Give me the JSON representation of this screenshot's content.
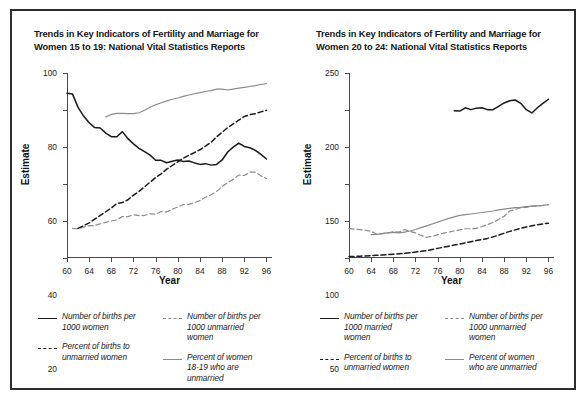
{
  "figure": {
    "border_color": "#2c2c2c",
    "background": "#ffffff"
  },
  "colors": {
    "black": "#1a1a1a",
    "gray": "#8a8a8a",
    "axis": "#4a4a4a",
    "text": "#161616"
  },
  "panels": [
    {
      "id": "panel-left",
      "title_line1": "Trends in Key Indicators of Fertility and Marriage for",
      "title_line2": "Women 15 to 19: National Vital Statistics Reports",
      "xlabel": "Year",
      "ylabel": "Estimate",
      "legend": [
        {
          "label_line1": "Number of births per",
          "label_line2": "1000 women",
          "label_line3": "",
          "style": "solid",
          "color": "#1a1a1a"
        },
        {
          "label_line1": "Number of births per",
          "label_line2": "1000 unmarried",
          "label_line3": "women",
          "style": "dashed",
          "color": "#8a8a8a"
        },
        {
          "label_line1": "Percent of births to",
          "label_line2": "unmarried women",
          "label_line3": "",
          "style": "dashed",
          "color": "#1a1a1a"
        },
        {
          "label_line1": "Percent of women",
          "label_line2": "18-19 who are",
          "label_line3": "unmarried",
          "style": "solid",
          "color": "#8a8a8a"
        }
      ]
    },
    {
      "id": "panel-right",
      "title_line1": "Trends in Key Indicators of Fertility and Marriage for",
      "title_line2": "Women 20 to 24: National Vital Statistics Reports",
      "xlabel": "Year",
      "ylabel": "Estimate",
      "legend": [
        {
          "label_line1": "Number of births per",
          "label_line2": "1000 married",
          "label_line3": "women",
          "style": "solid",
          "color": "#1a1a1a"
        },
        {
          "label_line1": "Number of births per",
          "label_line2": "1000 unmarried",
          "label_line3": "women",
          "style": "dashed",
          "color": "#8a8a8a"
        },
        {
          "label_line1": "Percent of births to",
          "label_line2": "unmarried women",
          "label_line3": "",
          "style": "dashed",
          "color": "#1a1a1a"
        },
        {
          "label_line1": "Percent of women",
          "label_line2": "who are unmarried",
          "label_line3": "",
          "style": "solid",
          "color": "#8a8a8a"
        }
      ]
    }
  ],
  "chart_data": [
    {
      "type": "line",
      "title": "Trends in Key Indicators of Fertility and Marriage for Women 15 to 19: National Vital Statistics Reports",
      "xlabel": "Year",
      "ylabel": "Estimate",
      "xlim": [
        60,
        97
      ],
      "ylim": [
        0,
        100
      ],
      "xticks": [
        60,
        64,
        68,
        72,
        76,
        80,
        84,
        88,
        92,
        96
      ],
      "yticks": [
        0,
        20,
        40,
        60,
        80,
        100
      ],
      "grid": false,
      "legend_position": "below",
      "series": [
        {
          "name": "Number of births per 1000 women",
          "style": "solid",
          "color": "#1a1a1a",
          "x": [
            60,
            61,
            62,
            63,
            64,
            65,
            66,
            67,
            68,
            69,
            70,
            71,
            72,
            73,
            74,
            75,
            76,
            77,
            78,
            79,
            80,
            81,
            82,
            83,
            84,
            85,
            86,
            87,
            88,
            89,
            90,
            91,
            92,
            93,
            94,
            95,
            96
          ],
          "values": [
            89.1,
            88.6,
            81.4,
            76.7,
            73.1,
            70.5,
            70.3,
            67.5,
            65.6,
            65.5,
            68.3,
            64.5,
            61.7,
            59.3,
            57.5,
            55.6,
            52.8,
            52.8,
            51.5,
            52.3,
            53.0,
            52.2,
            52.4,
            51.4,
            50.6,
            51.0,
            50.2,
            50.6,
            53.0,
            57.3,
            59.9,
            62.1,
            60.3,
            59.6,
            58.2,
            56.0,
            53.5
          ]
        },
        {
          "name": "Number of births per 1000 unmarried women",
          "style": "dashed",
          "color": "#8a8a8a",
          "x": [
            61,
            62,
            63,
            64,
            65,
            66,
            67,
            68,
            69,
            70,
            71,
            72,
            73,
            74,
            75,
            76,
            77,
            78,
            79,
            80,
            81,
            82,
            83,
            84,
            85,
            86,
            87,
            88,
            89,
            90,
            91,
            92,
            93,
            94,
            95,
            96
          ],
          "values": [
            16.0,
            15.8,
            16.7,
            17.5,
            17.5,
            18.5,
            19.3,
            20.0,
            20.6,
            22.4,
            22.4,
            23.4,
            22.9,
            23.0,
            23.9,
            23.7,
            25.1,
            24.9,
            26.4,
            27.6,
            28.9,
            29.0,
            30.0,
            31.0,
            32.8,
            34.2,
            36.0,
            38.6,
            40.7,
            42.5,
            44.8,
            44.6,
            46.4,
            46.4,
            44.4,
            42.9
          ]
        },
        {
          "name": "Percent of births to unmarried women",
          "style": "dashed",
          "color": "#1a1a1a",
          "x": [
            62,
            63,
            64,
            65,
            66,
            67,
            68,
            69,
            70,
            71,
            72,
            73,
            74,
            75,
            76,
            77,
            78,
            79,
            80,
            81,
            82,
            83,
            84,
            85,
            86,
            87,
            88,
            89,
            90,
            91,
            92,
            93,
            94,
            95,
            96
          ],
          "values": [
            16.0,
            17.5,
            19.0,
            21.0,
            23.0,
            25.0,
            27.0,
            29.5,
            30.0,
            31.5,
            34.0,
            36.0,
            38.5,
            41.0,
            43.5,
            45.5,
            48.0,
            50.0,
            52.0,
            54.0,
            55.5,
            57.0,
            58.5,
            60.5,
            62.5,
            65.5,
            68.0,
            70.5,
            72.5,
            74.5,
            76.5,
            77.5,
            78.0,
            79.0,
            79.8
          ]
        },
        {
          "name": "Percent of women 18-19 who are unmarried",
          "style": "solid",
          "color": "#8a8a8a",
          "x": [
            67,
            68,
            69,
            70,
            71,
            72,
            73,
            74,
            75,
            76,
            77,
            78,
            79,
            80,
            81,
            82,
            83,
            84,
            85,
            86,
            87,
            88,
            89,
            90,
            91,
            92,
            93,
            94,
            95,
            96
          ],
          "values": [
            76.3,
            77.6,
            78.2,
            78.2,
            78.0,
            78.0,
            78.5,
            79.9,
            81.5,
            82.8,
            83.9,
            84.9,
            85.8,
            86.5,
            87.4,
            88.1,
            88.8,
            89.4,
            90.0,
            90.5,
            91.3,
            91.3,
            90.8,
            91.3,
            91.8,
            92.2,
            92.7,
            93.2,
            93.8,
            94.3
          ]
        }
      ]
    },
    {
      "type": "line",
      "title": "Trends in Key Indicators of Fertility and Marriage for Women 20 to 24: National Vital Statistics Reports",
      "xlabel": "Year",
      "ylabel": "Estimate",
      "xlim": [
        60,
        97
      ],
      "ylim": [
        0,
        250
      ],
      "xticks": [
        60,
        64,
        68,
        72,
        76,
        80,
        84,
        88,
        92,
        96
      ],
      "yticks": [
        0,
        50,
        100,
        150,
        200,
        250
      ],
      "grid": false,
      "legend_position": "below",
      "series": [
        {
          "name": "Number of births per 1000 married women",
          "style": "solid",
          "color": "#1a1a1a",
          "x": [
            79,
            80,
            81,
            82,
            83,
            84,
            85,
            86,
            87,
            88,
            89,
            90,
            91,
            92,
            93,
            94,
            95,
            96
          ],
          "values": [
            199.0,
            198.5,
            203.0,
            200.5,
            202.5,
            203.0,
            200.5,
            200.5,
            205.0,
            209.5,
            212.5,
            213.5,
            209.0,
            200.5,
            196.0,
            203.0,
            209.0,
            214.5
          ]
        },
        {
          "name": "Number of births per 1000 unmarried women",
          "style": "dashed",
          "color": "#8a8a8a",
          "x": [
            60,
            61,
            62,
            63,
            64,
            65,
            66,
            67,
            68,
            69,
            70,
            71,
            72,
            73,
            74,
            75,
            76,
            77,
            78,
            79,
            80,
            81,
            82,
            83,
            84,
            85,
            86,
            87,
            88,
            89,
            90,
            91,
            92,
            93,
            94,
            95,
            96
          ],
          "values": [
            39.7,
            39.0,
            38.3,
            37.5,
            36.0,
            32.0,
            33.0,
            34.0,
            35.5,
            35.0,
            38.5,
            36.0,
            34.0,
            30.5,
            28.0,
            29.0,
            31.5,
            33.5,
            35.0,
            36.5,
            38.0,
            39.5,
            39.5,
            40.0,
            42.5,
            45.0,
            48.0,
            52.0,
            56.5,
            63.5,
            65.5,
            68.0,
            68.5,
            70.0,
            70.5,
            71.0,
            72.0
          ]
        },
        {
          "name": "Percent of births to unmarried women",
          "style": "dashed",
          "color": "#1a1a1a",
          "x": [
            60,
            61,
            62,
            63,
            64,
            65,
            66,
            67,
            68,
            69,
            70,
            71,
            72,
            73,
            74,
            75,
            76,
            77,
            78,
            79,
            80,
            81,
            82,
            83,
            84,
            85,
            86,
            87,
            88,
            89,
            90,
            91,
            92,
            93,
            94,
            95,
            96
          ],
          "values": [
            2.0,
            2.2,
            2.5,
            2.8,
            3.2,
            3.6,
            4.0,
            4.5,
            5.0,
            5.6,
            6.2,
            7.0,
            8.0,
            9.0,
            10.0,
            11.5,
            13.0,
            14.5,
            16.0,
            17.5,
            19.0,
            20.5,
            22.0,
            23.5,
            25.0,
            26.5,
            28.5,
            31.0,
            33.5,
            36.0,
            38.0,
            40.0,
            42.0,
            43.5,
            45.0,
            46.0,
            47.0
          ]
        },
        {
          "name": "Percent of women who are unmarried",
          "style": "solid",
          "color": "#8a8a8a",
          "x": [
            64,
            65,
            66,
            67,
            68,
            69,
            70,
            71,
            72,
            73,
            74,
            75,
            76,
            77,
            78,
            79,
            80,
            81,
            82,
            83,
            84,
            85,
            86,
            87,
            88,
            89,
            90,
            91,
            92,
            93,
            94,
            95,
            96
          ],
          "values": [
            31.5,
            32.0,
            33.0,
            34.0,
            34.5,
            34.0,
            35.0,
            36.5,
            38.5,
            41.0,
            43.5,
            46.0,
            48.5,
            51.0,
            53.5,
            55.5,
            57.5,
            58.5,
            59.5,
            60.5,
            61.5,
            62.5,
            63.5,
            65.0,
            66.0,
            67.0,
            68.0,
            68.5,
            69.5,
            70.0,
            70.5,
            71.0,
            72.0
          ]
        }
      ]
    }
  ]
}
